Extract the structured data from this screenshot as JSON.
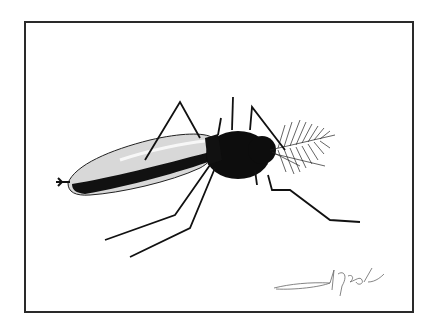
{
  "artwork": {
    "subject": "mosquito ink illustration",
    "signature": "signature",
    "colors": {
      "ink": "#111111",
      "frame": "#2a2a2a",
      "paper": "#ffffff"
    }
  }
}
